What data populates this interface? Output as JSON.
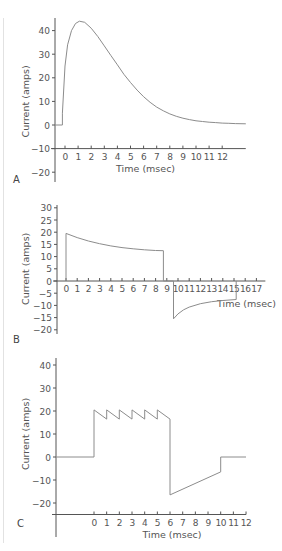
{
  "colors": {
    "axis": "#555555",
    "line": "#8c8c8c",
    "text": "#555555"
  },
  "chart_data": [
    {
      "panel": "A",
      "type": "line",
      "title": "",
      "xlabel": "Time (msec)",
      "ylabel": "Current (amps)",
      "xticks": [
        0,
        1,
        2,
        3,
        4,
        5,
        6,
        7,
        8,
        9,
        10,
        11,
        12
      ],
      "yticks": [
        40,
        30,
        20,
        10,
        0,
        -10,
        -20
      ],
      "xlim": [
        -0.8,
        13.8
      ],
      "ylim": [
        -24,
        46
      ],
      "x_axis_at": -10,
      "grid": false,
      "series": [
        {
          "name": "current",
          "x": [
            -0.8,
            -0.2,
            -0.2,
            0,
            0.2,
            0.5,
            0.8,
            1.1,
            1.5,
            2,
            2.5,
            3,
            3.5,
            4,
            4.5,
            5,
            5.5,
            6,
            6.5,
            7,
            7.5,
            8,
            8.5,
            9,
            9.5,
            10,
            10.5,
            11,
            11.5,
            12,
            12.5,
            13,
            13.8
          ],
          "y": [
            0,
            0,
            5,
            25,
            34,
            40,
            43,
            44,
            43.5,
            41,
            37.5,
            33.5,
            29.5,
            25.5,
            21.5,
            18,
            14.8,
            12,
            9.6,
            7.6,
            6,
            4.7,
            3.7,
            2.9,
            2.3,
            1.8,
            1.5,
            1.2,
            1,
            0.8,
            0.7,
            0.6,
            0.5
          ]
        }
      ]
    },
    {
      "panel": "B",
      "type": "line",
      "title": "",
      "xlabel": "Time (msec)",
      "ylabel": "Current (amps)",
      "xticks": [
        0,
        1,
        2,
        3,
        4,
        5,
        6,
        7,
        8,
        9,
        10,
        11,
        12,
        13,
        14,
        15,
        16,
        17
      ],
      "yticks": [
        30,
        25,
        20,
        15,
        10,
        5,
        0,
        -5,
        -10,
        -15,
        -20
      ],
      "xlim": [
        -1,
        17.8
      ],
      "ylim": [
        -21,
        31
      ],
      "x_axis_at": 0,
      "grid": false,
      "series": [
        {
          "name": "current",
          "x": [
            0,
            0,
            1,
            2,
            3,
            4,
            5,
            6,
            7,
            8,
            8.7,
            8.7,
            9.6,
            9.6,
            10,
            10.5,
            11,
            12,
            13,
            14,
            15.2,
            15.2
          ],
          "y": [
            0,
            19.5,
            17.8,
            16.4,
            15.3,
            14.4,
            13.7,
            13.2,
            12.8,
            12.5,
            12.4,
            0,
            0,
            -15.5,
            -13.5,
            -11.8,
            -10.7,
            -9.3,
            -8.5,
            -8,
            -7.6,
            0
          ]
        }
      ]
    },
    {
      "panel": "C",
      "type": "line",
      "title": "",
      "xlabel": "Time (msec)",
      "ylabel": "Current (amps)",
      "xticks": [
        0,
        1,
        2,
        3,
        4,
        5,
        6,
        7,
        8,
        9,
        10,
        11,
        12
      ],
      "yticks": [
        40,
        30,
        20,
        10,
        0,
        -10,
        -20
      ],
      "xlim": [
        -3,
        12
      ],
      "ylim": [
        -25,
        42
      ],
      "x_axis_at": -25,
      "grid": false,
      "series": [
        {
          "name": "current",
          "x": [
            -3,
            0,
            0,
            1,
            1,
            2,
            2,
            3,
            3,
            4,
            4,
            5,
            5,
            6,
            6,
            10,
            10,
            12
          ],
          "y": [
            0,
            0,
            20.5,
            16.5,
            20.5,
            16.5,
            20.5,
            16.5,
            20.5,
            16.5,
            20.5,
            16.5,
            20.5,
            16.5,
            -16.5,
            -6.5,
            0,
            0
          ]
        }
      ]
    }
  ],
  "panels": {
    "A": {
      "label": "A",
      "box": {
        "x0": 55,
        "top": 18,
        "bottom": 182,
        "px_per_x": 13.1,
        "x_origin": 65,
        "px_per_y": 2.36,
        "y_origin": 125
      }
    },
    "B": {
      "label": "B",
      "box": {
        "x0": 57,
        "top": 205,
        "bottom": 334,
        "px_per_x": 11.2,
        "x_origin": 66,
        "px_per_y": 2.44,
        "y_origin": 281
      }
    },
    "C": {
      "label": "C",
      "box": {
        "x0": 56,
        "top": 358,
        "bottom": 537,
        "px_per_x": 12.67,
        "x_origin": 94,
        "px_per_y": 2.3,
        "y_origin": 457
      }
    }
  }
}
